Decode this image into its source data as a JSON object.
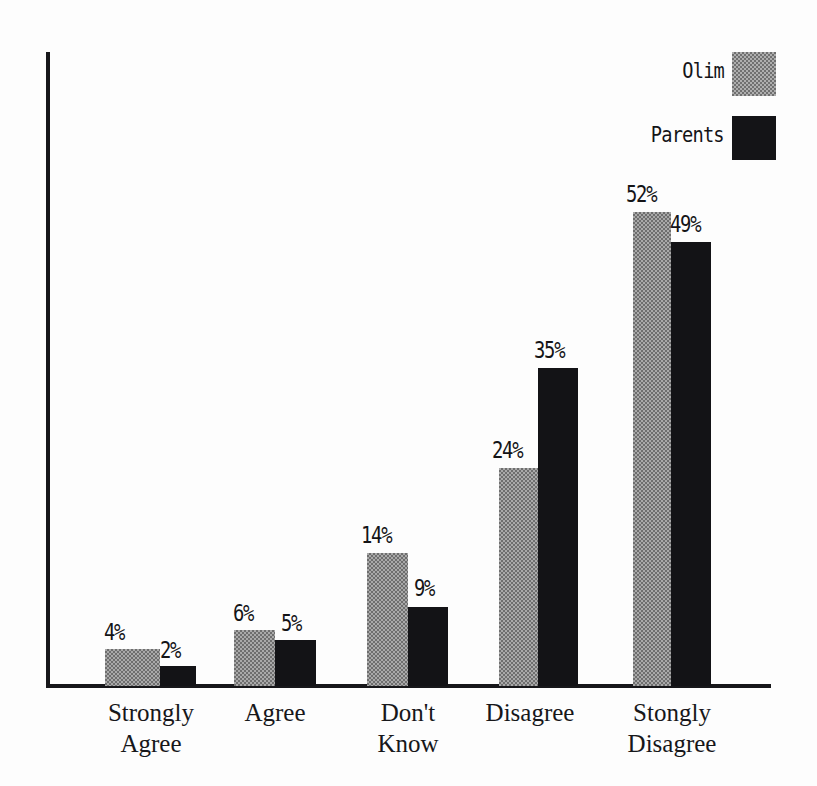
{
  "chart_data": {
    "type": "bar",
    "title": "",
    "subtitle": "",
    "xlabel": "",
    "ylabel": "",
    "grid": false,
    "legend_position": "top-right",
    "ylim": [
      0,
      60
    ],
    "value_suffix": "%",
    "categories": [
      "Strongly Agree",
      "Agree",
      "Don't Know",
      "Disagree",
      "Stongly Disagree"
    ],
    "category_lines": [
      [
        "Strongly",
        "Agree"
      ],
      [
        "Agree"
      ],
      [
        "Don't",
        "Know"
      ],
      [
        "Disagree"
      ],
      [
        "Stongly",
        "Disagree"
      ]
    ],
    "series": [
      {
        "name": "Olim",
        "color": "#a9a9a9",
        "fill": "stipple-gray",
        "values": [
          4,
          6,
          14,
          24,
          52
        ],
        "value_labels": [
          "4%",
          "6%",
          "14%",
          "24%",
          "52%"
        ]
      },
      {
        "name": "Parents",
        "color": "#131316",
        "fill": "solid-black",
        "values": [
          2,
          5,
          9,
          35,
          49
        ],
        "value_labels": [
          "2%",
          "5%",
          "9%",
          "35%",
          "49%"
        ]
      }
    ]
  },
  "legend": {
    "items": [
      {
        "label": "Olim",
        "swatch": "stipple-gray-swatch"
      },
      {
        "label": "Parents",
        "swatch": "solid-black-swatch"
      }
    ]
  },
  "axes": {
    "axis_color": "#17171a",
    "baseline_visible": true,
    "y_axis_visible": true,
    "tick_labels": []
  },
  "bars": [
    {
      "series": "Olim",
      "category": "Strongly Agree",
      "label": "4%",
      "left": 105,
      "width": 55,
      "height": 37,
      "label_left": 104,
      "label_top": 619
    },
    {
      "series": "Parents",
      "category": "Strongly Agree",
      "label": "2%",
      "left": 160,
      "width": 36,
      "height": 20,
      "label_left": 160,
      "label_top": 637
    },
    {
      "series": "Olim",
      "category": "Agree",
      "label": "6%",
      "left": 234,
      "width": 41,
      "height": 56,
      "label_left": 233,
      "label_top": 600
    },
    {
      "series": "Parents",
      "category": "Agree",
      "label": "5%",
      "left": 275,
      "width": 41,
      "height": 46,
      "label_left": 281,
      "label_top": 610
    },
    {
      "series": "Olim",
      "category": "Don't Know",
      "label": "14%",
      "left": 367,
      "width": 41,
      "height": 133,
      "label_left": 361,
      "label_top": 522
    },
    {
      "series": "Parents",
      "category": "Don't Know",
      "label": "9%",
      "left": 408,
      "width": 40,
      "height": 79,
      "label_left": 414,
      "label_top": 575
    },
    {
      "series": "Olim",
      "category": "Disagree",
      "label": "24%",
      "left": 499,
      "width": 39,
      "height": 218,
      "label_left": 492,
      "label_top": 437
    },
    {
      "series": "Parents",
      "category": "Disagree",
      "label": "35%",
      "left": 538,
      "width": 40,
      "height": 318,
      "label_left": 534,
      "label_top": 337
    },
    {
      "series": "Olim",
      "category": "Stongly Disagree",
      "label": "52%",
      "left": 633,
      "width": 38,
      "height": 474,
      "label_left": 626,
      "label_top": 181
    },
    {
      "series": "Parents",
      "category": "Stongly Disagree",
      "label": "49%",
      "left": 671,
      "width": 40,
      "height": 444,
      "label_left": 670,
      "label_top": 211
    }
  ],
  "category_positions": [
    {
      "left": 76,
      "width": 150
    },
    {
      "left": 200,
      "width": 150
    },
    {
      "left": 333,
      "width": 150
    },
    {
      "left": 455,
      "width": 150
    },
    {
      "left": 592,
      "width": 160
    }
  ]
}
